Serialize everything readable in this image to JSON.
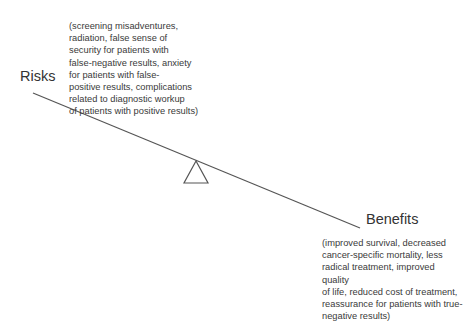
{
  "diagram": {
    "type": "balance-scale",
    "left": {
      "label": "Risks",
      "description": "(screening misadventures,\nradiation, false sense of\nsecurity for patients with\nfalse-negative results, anxiety\nfor patients with false-\npositive results, complications\nrelated to diagnostic workup\nof patients with positive results)"
    },
    "right": {
      "label": "Benefits",
      "description": "(improved survival, decreased\ncancer-specific mortality, less\nradical treatment, improved quality\nof life, reduced cost of treatment,\nreassurance for patients with true-\nnegative results)"
    },
    "colors": {
      "line": "#555555",
      "text": "#333333"
    }
  }
}
